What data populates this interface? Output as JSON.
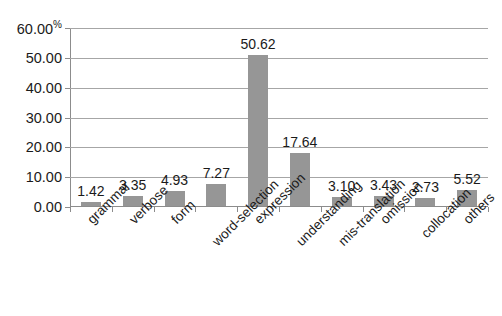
{
  "chart_data": {
    "type": "bar",
    "title": "",
    "subtitle": "",
    "xlabel": "",
    "ylabel": "",
    "ylim": [
      0,
      60
    ],
    "ytick_step": 10,
    "grid": true,
    "legend": false,
    "axis_unit": "%",
    "bar_color": "#969696",
    "gridline_color": "#a6a6a6",
    "axis_color": "#8c8c8c",
    "categories": [
      "grammar",
      "verbose",
      "form",
      "word-selection",
      "expression",
      "understanding",
      "mis-translation",
      "omission",
      "collocation",
      "others"
    ],
    "values": [
      1.42,
      3.35,
      4.93,
      7.27,
      50.62,
      17.64,
      3.1,
      3.43,
      2.73,
      5.52
    ],
    "value_labels": [
      "1.42",
      "3.35",
      "4.93",
      "7.27",
      "50.62",
      "17.64",
      "3.10",
      "3.43",
      "2.73",
      "5.52"
    ],
    "yticks": [
      60,
      50,
      40,
      30,
      20,
      10,
      0
    ],
    "ytick_labels": [
      "60.00",
      "50.00",
      "40.00",
      "30.00",
      "20.00",
      "10.00",
      "0.00"
    ],
    "ytick_suffixes": [
      "%",
      "",
      "",
      "",
      "",
      "",
      ""
    ]
  }
}
